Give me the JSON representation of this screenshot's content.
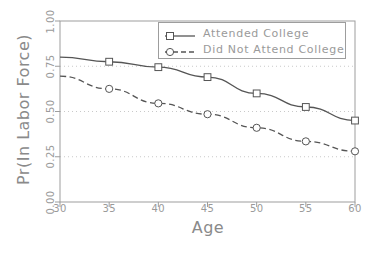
{
  "chart_data": {
    "type": "line",
    "title": "",
    "xlabel": "Age",
    "ylabel": "Pr(In Labor Force)",
    "xlim": [
      30,
      60
    ],
    "ylim": [
      0.0,
      1.0
    ],
    "xticks": [
      "30",
      "35",
      "40",
      "45",
      "50",
      "55",
      "60"
    ],
    "yticks": [
      "0.00",
      "0.25",
      "0.50",
      "0.75",
      "1.00"
    ],
    "grid": "horizontal dotted gridlines at 0.25, 0.50, 0.75",
    "legend_position": "top-right inside plot",
    "x": [
      30,
      35,
      40,
      45,
      50,
      55,
      60
    ],
    "series": [
      {
        "name": "Attended College",
        "marker": "square",
        "linestyle": "solid",
        "color": "#555555",
        "values": [
          0.8,
          0.775,
          0.745,
          0.69,
          0.6,
          0.525,
          0.45
        ]
      },
      {
        "name": "Did Not Attend College",
        "marker": "circle",
        "linestyle": "dashed",
        "color": "#555555",
        "values": [
          0.695,
          0.625,
          0.545,
          0.485,
          0.41,
          0.335,
          0.28
        ]
      }
    ]
  },
  "axes": {
    "y_title": "Pr(In Labor Force)",
    "x_title": "Age",
    "y_tick_labels": [
      "1.00",
      "0.75",
      "0.50",
      "0.25",
      "0.00"
    ],
    "x_tick_labels": [
      "30",
      "35",
      "40",
      "45",
      "50",
      "55",
      "60"
    ]
  },
  "legend": {
    "entries": [
      {
        "label": "Attended College",
        "marker": "square-marker",
        "line": "solid-line"
      },
      {
        "label": "Did Not Attend College",
        "marker": "circle-marker",
        "line": "dashed-line"
      }
    ]
  },
  "colors": {
    "frame": "#9d9d9d",
    "grid": "#c9c9c9",
    "line": "#555555",
    "text": "#9a9a9a",
    "background": "#ffffff"
  },
  "artifacts": {
    "top_clipped_text": ""
  }
}
